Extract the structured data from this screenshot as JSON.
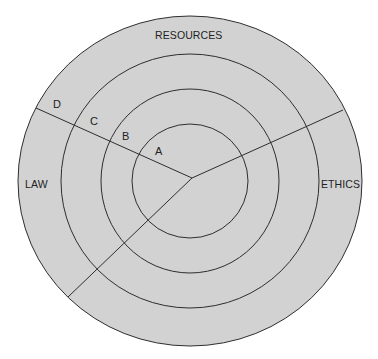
{
  "diagram": {
    "type": "concentric-circle-sector-diagram",
    "colors": {
      "background": "#ffffff",
      "fill": "#d2d2d2",
      "stroke": "#2e2e2e",
      "text": "#222222"
    },
    "center": {
      "x": 190,
      "y": 181
    },
    "rings": [
      {
        "id": "A",
        "label": "A",
        "rx": 58,
        "ry": 57
      },
      {
        "id": "B",
        "label": "B",
        "rx": 89,
        "ry": 92
      },
      {
        "id": "C",
        "label": "C",
        "rx": 129,
        "ry": 127
      },
      {
        "id": "D",
        "label": "D",
        "rx": 172,
        "ry": 165
      }
    ],
    "sectors": [
      {
        "id": "resources",
        "label": "RESOURCES"
      },
      {
        "id": "law",
        "label": "LAW"
      },
      {
        "id": "ethics",
        "label": "ETHICS"
      }
    ],
    "dividers": [
      {
        "id": "upper-left",
        "x1": 192,
        "y1": 178,
        "x2": 36,
        "y2": 108
      },
      {
        "id": "upper-right",
        "x1": 192,
        "y1": 178,
        "x2": 343,
        "y2": 110
      },
      {
        "id": "lower-left",
        "x1": 192,
        "y1": 178,
        "x2": 68,
        "y2": 297
      }
    ]
  }
}
